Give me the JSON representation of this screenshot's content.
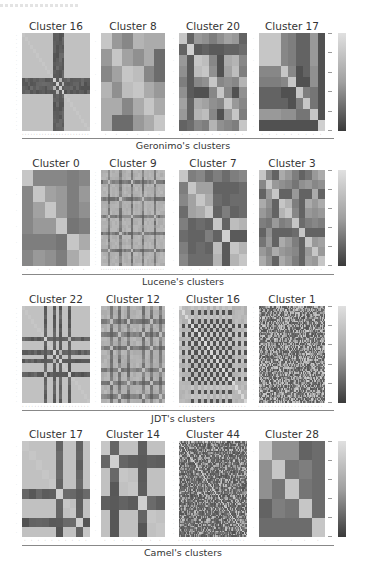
{
  "chart_data": [
    {
      "type": "heatmap",
      "group": "Geronimo's clusters",
      "colorbar": {
        "range": [
          0,
          1
        ],
        "colors": [
          "#3a3a3a",
          "#e0e0e0"
        ]
      },
      "panels": [
        {
          "title": "Cluster 16",
          "size": 24,
          "pattern": "cross",
          "bands": [
            11,
            12,
            13,
            14
          ],
          "band_color": "#3e3e3e"
        },
        {
          "title": "Cluster 8",
          "size": 6,
          "matrix": [
            [
              0.85,
              0.6,
              0.5,
              0.75,
              0.7,
              0.7
            ],
            [
              0.6,
              0.85,
              0.65,
              0.55,
              0.7,
              0.35
            ],
            [
              0.5,
              0.65,
              0.85,
              0.8,
              0.5,
              0.35
            ],
            [
              0.75,
              0.55,
              0.8,
              0.85,
              0.7,
              0.6
            ],
            [
              0.7,
              0.7,
              0.5,
              0.7,
              0.85,
              0.7
            ],
            [
              0.7,
              0.35,
              0.35,
              0.6,
              0.7,
              0.85
            ]
          ]
        },
        {
          "title": "Cluster 20",
          "size": 9,
          "matrix": [
            [
              0.85,
              0.3,
              0.6,
              0.55,
              0.45,
              0.55,
              0.65,
              0.6,
              0.3
            ],
            [
              0.3,
              0.9,
              0.25,
              0.3,
              0.25,
              0.25,
              0.3,
              0.3,
              0.35
            ],
            [
              0.6,
              0.25,
              0.85,
              0.8,
              0.5,
              0.2,
              0.7,
              0.75,
              0.5
            ],
            [
              0.55,
              0.25,
              0.8,
              0.85,
              0.55,
              0.2,
              0.65,
              0.8,
              0.45
            ],
            [
              0.45,
              0.25,
              0.5,
              0.55,
              0.85,
              0.5,
              0.55,
              0.5,
              0.75
            ],
            [
              0.55,
              0.25,
              0.2,
              0.2,
              0.5,
              0.85,
              0.5,
              0.2,
              0.55
            ],
            [
              0.65,
              0.3,
              0.7,
              0.65,
              0.55,
              0.5,
              0.85,
              0.6,
              0.5
            ],
            [
              0.6,
              0.3,
              0.75,
              0.8,
              0.5,
              0.2,
              0.6,
              0.85,
              0.45
            ],
            [
              0.3,
              0.35,
              0.5,
              0.45,
              0.75,
              0.55,
              0.5,
              0.45,
              0.85
            ]
          ]
        },
        {
          "title": "Cluster 17",
          "size": 9,
          "matrix": [
            [
              0.85,
              0.85,
              0.85,
              0.5,
              0.45,
              0.3,
              0.3,
              0.6,
              0.2
            ],
            [
              0.85,
              0.85,
              0.85,
              0.5,
              0.45,
              0.3,
              0.3,
              0.6,
              0.2
            ],
            [
              0.85,
              0.85,
              0.85,
              0.5,
              0.45,
              0.3,
              0.3,
              0.6,
              0.2
            ],
            [
              0.5,
              0.5,
              0.5,
              0.85,
              0.5,
              0.2,
              0.3,
              0.55,
              0.2
            ],
            [
              0.45,
              0.45,
              0.45,
              0.5,
              0.85,
              0.2,
              0.2,
              0.55,
              0.2
            ],
            [
              0.3,
              0.3,
              0.3,
              0.2,
              0.2,
              0.85,
              0.45,
              0.4,
              0.2
            ],
            [
              0.3,
              0.3,
              0.3,
              0.3,
              0.2,
              0.45,
              0.85,
              0.4,
              0.2
            ],
            [
              0.6,
              0.6,
              0.6,
              0.55,
              0.55,
              0.4,
              0.4,
              0.85,
              0.2
            ],
            [
              0.2,
              0.2,
              0.2,
              0.2,
              0.2,
              0.2,
              0.2,
              0.2,
              0.9
            ]
          ]
        }
      ]
    },
    {
      "type": "heatmap",
      "group": "Lucene's clusters",
      "colorbar": {
        "range": [
          0,
          1
        ],
        "colors": [
          "#3a3a3a",
          "#e0e0e0"
        ]
      },
      "panels": [
        {
          "title": "Cluster 0",
          "size": 6,
          "matrix": [
            [
              0.85,
              0.5,
              0.5,
              0.5,
              0.45,
              0.5
            ],
            [
              0.5,
              0.85,
              0.65,
              0.6,
              0.45,
              0.6
            ],
            [
              0.5,
              0.65,
              0.85,
              0.6,
              0.45,
              0.55
            ],
            [
              0.5,
              0.6,
              0.6,
              0.85,
              0.4,
              0.45
            ],
            [
              0.45,
              0.45,
              0.45,
              0.4,
              0.85,
              0.7
            ],
            [
              0.5,
              0.6,
              0.55,
              0.45,
              0.7,
              0.85
            ]
          ]
        },
        {
          "title": "Cluster 9",
          "size": 28,
          "pattern": "grid-lines",
          "bands": [
            3,
            8,
            13,
            18,
            23
          ],
          "band_color": "#6a6a6a"
        },
        {
          "title": "Cluster 7",
          "size": 8,
          "matrix": [
            [
              0.85,
              0.45,
              0.5,
              0.35,
              0.45,
              0.35,
              0.45,
              0.5
            ],
            [
              0.45,
              0.85,
              0.65,
              0.65,
              0.3,
              0.3,
              0.3,
              0.35
            ],
            [
              0.5,
              0.65,
              0.85,
              0.7,
              0.35,
              0.3,
              0.35,
              0.35
            ],
            [
              0.35,
              0.65,
              0.7,
              0.85,
              0.3,
              0.45,
              0.3,
              0.35
            ],
            [
              0.45,
              0.3,
              0.35,
              0.3,
              0.85,
              0.3,
              0.8,
              0.75
            ],
            [
              0.35,
              0.3,
              0.3,
              0.45,
              0.3,
              0.9,
              0.25,
              0.25
            ],
            [
              0.45,
              0.3,
              0.35,
              0.3,
              0.8,
              0.25,
              0.85,
              0.75
            ],
            [
              0.5,
              0.35,
              0.35,
              0.35,
              0.75,
              0.25,
              0.75,
              0.85
            ]
          ]
        },
        {
          "title": "Cluster 3",
          "size": 10,
          "matrix": [
            [
              0.85,
              0.5,
              0.3,
              0.7,
              0.6,
              0.45,
              0.3,
              0.4,
              0.6,
              0.7
            ],
            [
              0.5,
              0.85,
              0.6,
              0.55,
              0.5,
              0.4,
              0.55,
              0.6,
              0.5,
              0.55
            ],
            [
              0.3,
              0.6,
              0.85,
              0.3,
              0.3,
              0.6,
              0.3,
              0.3,
              0.7,
              0.3
            ],
            [
              0.7,
              0.55,
              0.3,
              0.85,
              0.75,
              0.45,
              0.3,
              0.7,
              0.6,
              0.7
            ],
            [
              0.6,
              0.5,
              0.3,
              0.75,
              0.85,
              0.5,
              0.3,
              0.6,
              0.55,
              0.6
            ],
            [
              0.45,
              0.4,
              0.6,
              0.45,
              0.5,
              0.85,
              0.35,
              0.45,
              0.5,
              0.45
            ],
            [
              0.3,
              0.55,
              0.3,
              0.3,
              0.3,
              0.35,
              0.85,
              0.3,
              0.3,
              0.3
            ],
            [
              0.4,
              0.6,
              0.3,
              0.7,
              0.6,
              0.45,
              0.3,
              0.85,
              0.6,
              0.65
            ],
            [
              0.6,
              0.5,
              0.7,
              0.6,
              0.55,
              0.5,
              0.3,
              0.6,
              0.85,
              0.6
            ],
            [
              0.7,
              0.55,
              0.3,
              0.7,
              0.6,
              0.45,
              0.3,
              0.65,
              0.6,
              0.85
            ]
          ]
        }
      ]
    },
    {
      "type": "heatmap",
      "group": "JDT's clusters",
      "colorbar": {
        "range": [
          0,
          1
        ],
        "colors": [
          "#3a3a3a",
          "#e0e0e0"
        ]
      },
      "panels": [
        {
          "title": "Cluster 22",
          "size": 22,
          "pattern": "cross",
          "bands": [
            7,
            10,
            12,
            15
          ],
          "band_color": "#505050"
        },
        {
          "title": "Cluster 12",
          "size": 22,
          "pattern": "grid-lines",
          "bands": [
            3,
            6,
            9,
            14,
            17,
            20
          ],
          "band_color": "#4a4a4a"
        },
        {
          "title": "Cluster 16",
          "size": 22,
          "pattern": "checker-cross",
          "bands": [
            4,
            6,
            8,
            10,
            12,
            14,
            16
          ],
          "band_color": "#2e2e2e"
        },
        {
          "title": "Cluster 1",
          "size": 60,
          "pattern": "noise",
          "band_color": "#3a3a3a"
        }
      ]
    },
    {
      "type": "heatmap",
      "group": "Camel's clusters",
      "colorbar": {
        "range": [
          0,
          1
        ],
        "colors": [
          "#3a3a3a",
          "#e0e0e0"
        ]
      },
      "panels": [
        {
          "title": "Cluster 17",
          "size": 10,
          "pattern": "cross",
          "bands": [
            5,
            8
          ],
          "band_color": "#4a4a4a"
        },
        {
          "title": "Cluster 14",
          "size": 7,
          "pattern": "cross",
          "bands": [
            1,
            4
          ],
          "band_color": "#555555"
        },
        {
          "title": "Cluster 44",
          "size": 60,
          "pattern": "noise-diag",
          "band_color": "#3a3a3a"
        },
        {
          "title": "Cluster 28",
          "size": 5,
          "matrix": [
            [
              0.85,
              0.55,
              0.55,
              0.3,
              0.35
            ],
            [
              0.55,
              0.85,
              0.4,
              0.45,
              0.35
            ],
            [
              0.55,
              0.4,
              0.85,
              0.4,
              0.35
            ],
            [
              0.3,
              0.45,
              0.4,
              0.85,
              0.35
            ],
            [
              0.35,
              0.35,
              0.35,
              0.35,
              0.85
            ]
          ]
        }
      ]
    }
  ],
  "rows": [
    {
      "caption": "Geronimo's clusters",
      "titles": [
        "Cluster 16",
        "Cluster 8",
        "Cluster 20",
        "Cluster 17"
      ]
    },
    {
      "caption": "Lucene's clusters",
      "titles": [
        "Cluster 0",
        "Cluster 9",
        "Cluster 7",
        "Cluster 3"
      ]
    },
    {
      "caption": "JDT's clusters",
      "titles": [
        "Cluster 22",
        "Cluster 12",
        "Cluster 16",
        "Cluster 1"
      ]
    },
    {
      "caption": "Camel's clusters",
      "titles": [
        "Cluster 17",
        "Cluster 14",
        "Cluster 44",
        "Cluster 28"
      ]
    }
  ]
}
